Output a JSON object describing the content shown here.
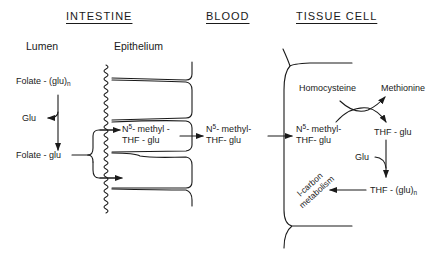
{
  "headers": {
    "intestine": "INTESTINE",
    "blood": "BLOOD",
    "tissue_cell": "TISSUE CELL"
  },
  "subheaders": {
    "lumen": "Lumen",
    "epithelium": "Epithelium"
  },
  "lumen": {
    "folate_polyglu": "Folate - (glu)",
    "folate_polyglu_sub": "n",
    "glu": "Glu",
    "folate_glu": "Folate - glu"
  },
  "epithelium": {
    "n5_prefix": "N",
    "n5_sup": "5",
    "n5_methyl": "- methyl -",
    "thf_glu": "THF - glu"
  },
  "blood": {
    "n5_prefix": "N",
    "n5_sup": "5",
    "n5_methyl": "- methyl-",
    "thf_glu": "THF- glu"
  },
  "tissue": {
    "n5_prefix": "N",
    "n5_sup": "5",
    "n5_methyl": "- methyl-",
    "thf_glu": "THF- glu",
    "homocysteine": "Homocysteine",
    "methionine": "Methionine",
    "thf_glu_right": "THF - glu",
    "glu": "Glu",
    "thf_polyglu": "THF - (glu)",
    "thf_polyglu_sub": "n",
    "one_carbon_line1": "l-carbon",
    "one_carbon_line2": "metabolism"
  }
}
